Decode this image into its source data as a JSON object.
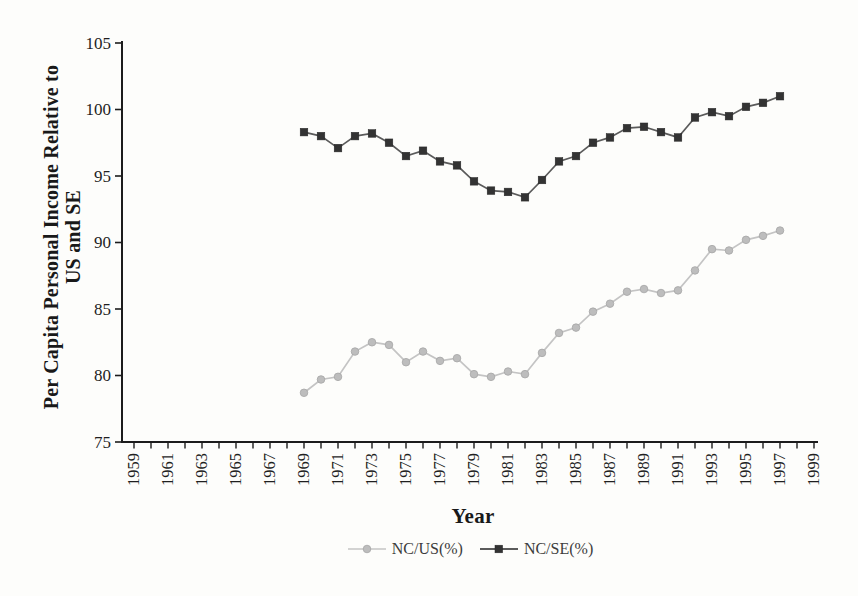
{
  "chart_data": {
    "type": "line",
    "title": "",
    "xlabel": "Year",
    "ylabel": "Per Capita Personal Income Relative to US and SE",
    "ylabel_line1": "Per Capita Personal Income Relative to",
    "ylabel_line2": "US and SE",
    "ylim": [
      75,
      105
    ],
    "yticks": [
      75,
      80,
      85,
      90,
      95,
      100,
      105
    ],
    "xticks": {
      "start": 1959,
      "end": 1999,
      "labels": [
        "1959",
        "1961",
        "1963",
        "1965",
        "1967",
        "1969",
        "1971",
        "1973",
        "1975",
        "1977",
        "1979",
        "1981",
        "1983",
        "1985",
        "1987",
        "1989",
        "1991",
        "1993",
        "1995",
        "1997",
        "1999"
      ]
    },
    "grid": false,
    "legend": {
      "position": "bottom"
    },
    "x": [
      1969,
      1970,
      1971,
      1972,
      1973,
      1974,
      1975,
      1976,
      1977,
      1978,
      1979,
      1980,
      1981,
      1982,
      1983,
      1984,
      1985,
      1986,
      1987,
      1988,
      1989,
      1990,
      1991,
      1992,
      1993,
      1994,
      1995,
      1996,
      1997
    ],
    "series": [
      {
        "name": "NC/US(%)",
        "marker": "circle",
        "color": "#bdbdbd",
        "marker_edge": "#a6a6a6",
        "line_color": "#c4c4c4",
        "values": [
          78.7,
          79.7,
          79.9,
          81.8,
          82.5,
          82.3,
          81.0,
          81.8,
          81.1,
          81.3,
          80.1,
          79.9,
          80.3,
          80.1,
          81.7,
          83.2,
          83.6,
          84.8,
          85.4,
          86.3,
          86.5,
          86.2,
          86.4,
          87.9,
          89.5,
          89.4,
          90.2,
          90.5,
          90.9
        ]
      },
      {
        "name": "NC/SE(%)",
        "marker": "square",
        "color": "#333333",
        "marker_edge": "#262626",
        "line_color": "#5b5b5b",
        "values": [
          98.3,
          98.0,
          97.1,
          98.0,
          98.2,
          97.5,
          96.5,
          96.9,
          96.1,
          95.8,
          94.6,
          93.9,
          93.8,
          93.4,
          94.7,
          96.1,
          96.5,
          97.5,
          97.9,
          98.6,
          98.7,
          98.3,
          97.9,
          99.4,
          99.8,
          99.5,
          100.2,
          100.5,
          101.0
        ]
      }
    ],
    "axis_color": "#1c1c1c",
    "tick_text_color": "#1f1f1f"
  }
}
